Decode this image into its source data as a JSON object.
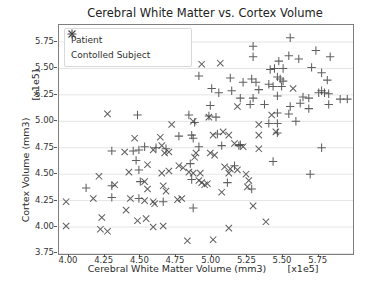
{
  "title": "Cerebral White Matter vs. Cortex Volume",
  "axes": {
    "xlabel": "Cerebral White Matter Volume (mm3)",
    "x_offset_label": "[x1e5]",
    "ylabel": "Cortex Volume (mm3)",
    "y_offset_label": "[x1e5]"
  },
  "legend": {
    "entries": [
      {
        "marker": "x",
        "label": "Patient"
      },
      {
        "marker": "+",
        "label": "Contolled Subject"
      }
    ]
  },
  "colors": {
    "marker": "#444444",
    "grid": "#e5e5e5",
    "frame": "#7f7f7f",
    "tick": "#555555"
  },
  "chart_data": {
    "type": "scatter",
    "title": "Cerebral White Matter vs. Cortex Volume",
    "xlabel": "Cerebral White Matter Volume (mm3)",
    "ylabel": "Cortex Volume (mm3)",
    "x_scale": "x1e5",
    "y_scale": "x1e5",
    "xlim": [
      3.93,
      5.99
    ],
    "ylim": [
      3.745,
      5.911
    ],
    "x_ticks": [
      "4.00",
      "4.25",
      "4.50",
      "4.75",
      "5.00",
      "5.25",
      "5.50",
      "5.75"
    ],
    "y_ticks": [
      "3.75",
      "4.00",
      "4.25",
      "4.50",
      "4.75",
      "5.00",
      "5.25",
      "5.50",
      "5.75"
    ],
    "grid": "horizontal",
    "legend_position": "upper left",
    "series": [
      {
        "name": "Patient",
        "marker": "x",
        "points": [
          [
            4.93,
            5.54
          ],
          [
            5.06,
            5.55
          ],
          [
            4.27,
            5.07
          ],
          [
            4.46,
            4.84
          ],
          [
            4.39,
            4.71
          ],
          [
            4.59,
            4.73
          ],
          [
            4.55,
            4.59
          ],
          [
            4.42,
            4.52
          ],
          [
            4.21,
            4.48
          ],
          [
            5.18,
            5.14
          ],
          [
            4.87,
            5.0
          ],
          [
            4.98,
            5.04
          ],
          [
            4.72,
            4.97
          ],
          [
            5.01,
            4.87
          ],
          [
            5.08,
            4.9
          ],
          [
            5.12,
            4.87
          ],
          [
            4.64,
            4.85
          ],
          [
            4.65,
            4.77
          ],
          [
            4.7,
            4.71
          ],
          [
            4.67,
            4.7
          ],
          [
            4.89,
            4.7
          ],
          [
            4.88,
            4.66
          ],
          [
            4.99,
            4.7
          ],
          [
            5.02,
            4.68
          ],
          [
            5.16,
            4.79
          ],
          [
            5.22,
            4.76
          ],
          [
            4.77,
            4.58
          ],
          [
            4.8,
            4.56
          ],
          [
            4.7,
            4.53
          ],
          [
            4.65,
            4.51
          ],
          [
            4.84,
            4.52
          ],
          [
            4.87,
            4.51
          ],
          [
            4.92,
            4.51
          ],
          [
            5.09,
            4.57
          ],
          [
            5.13,
            4.55
          ],
          [
            5.18,
            4.54
          ],
          [
            5.12,
            4.51
          ],
          [
            5.24,
            4.5
          ],
          [
            5.57,
            5.31
          ],
          [
            5.42,
            5.06
          ],
          [
            5.45,
            4.9
          ],
          [
            5.33,
            4.97
          ],
          [
            5.33,
            4.87
          ],
          [
            5.33,
            4.74
          ],
          [
            4.32,
            4.4
          ],
          [
            4.53,
            4.43
          ],
          [
            4.55,
            4.36
          ],
          [
            3.98,
            4.24
          ],
          [
            4.17,
            4.27
          ],
          [
            4.43,
            4.27
          ],
          [
            4.53,
            4.25
          ],
          [
            4.59,
            4.24
          ],
          [
            4.6,
            4.22
          ],
          [
            4.4,
            4.16
          ],
          [
            4.23,
            4.09
          ],
          [
            3.98,
            4.01
          ],
          [
            4.48,
            4.06
          ],
          [
            4.54,
            4.08
          ],
          [
            4.22,
            3.98
          ],
          [
            4.27,
            3.96
          ],
          [
            4.59,
            4.0
          ],
          [
            4.91,
            4.44
          ],
          [
            4.93,
            4.42
          ],
          [
            4.95,
            4.4
          ],
          [
            4.97,
            4.41
          ],
          [
            4.66,
            4.39
          ],
          [
            4.68,
            4.34
          ],
          [
            5.07,
            4.33
          ],
          [
            5.25,
            4.38
          ],
          [
            5.26,
            4.44
          ],
          [
            4.76,
            4.26
          ],
          [
            4.79,
            4.27
          ],
          [
            5.29,
            4.2
          ],
          [
            4.66,
            4.01
          ],
          [
            5.12,
            3.99
          ],
          [
            4.83,
            3.87
          ],
          [
            5.01,
            3.88
          ],
          [
            5.38,
            4.05
          ]
        ]
      },
      {
        "name": "Contolled Subject",
        "marker": "+",
        "points": [
          [
            5.29,
            5.71
          ],
          [
            5.29,
            5.61
          ],
          [
            4.91,
            5.43
          ],
          [
            5.13,
            5.41
          ],
          [
            5.22,
            5.37
          ],
          [
            5.28,
            5.4
          ],
          [
            5.31,
            5.37
          ],
          [
            5.0,
            5.31
          ],
          [
            5.05,
            5.27
          ],
          [
            5.14,
            5.29
          ],
          [
            5.2,
            5.22
          ],
          [
            5.29,
            5.22
          ],
          [
            5.55,
            5.79
          ],
          [
            5.54,
            5.62
          ],
          [
            5.61,
            5.59
          ],
          [
            5.73,
            5.67
          ],
          [
            5.83,
            5.61
          ],
          [
            5.47,
            5.57
          ],
          [
            5.7,
            5.51
          ],
          [
            5.41,
            5.49
          ],
          [
            5.44,
            5.5
          ],
          [
            5.5,
            5.5
          ],
          [
            5.77,
            5.46
          ],
          [
            5.81,
            5.39
          ],
          [
            5.46,
            5.42
          ],
          [
            5.48,
            5.4
          ],
          [
            5.5,
            5.38
          ],
          [
            5.4,
            5.35
          ],
          [
            5.43,
            5.33
          ],
          [
            5.49,
            5.33
          ],
          [
            5.77,
            5.29
          ],
          [
            5.79,
            5.27
          ],
          [
            5.82,
            5.26
          ],
          [
            5.75,
            5.27
          ],
          [
            5.33,
            5.3
          ],
          [
            5.46,
            5.24
          ],
          [
            5.64,
            5.23
          ],
          [
            5.68,
            5.22
          ],
          [
            5.9,
            5.21
          ],
          [
            5.95,
            5.21
          ],
          [
            4.48,
            5.06
          ],
          [
            4.3,
            4.72
          ],
          [
            4.45,
            4.72
          ],
          [
            4.49,
            4.73
          ],
          [
            4.53,
            4.76
          ],
          [
            4.61,
            4.75
          ],
          [
            4.47,
            4.63
          ],
          [
            4.49,
            4.54
          ],
          [
            4.99,
            5.15
          ],
          [
            5.27,
            5.16
          ],
          [
            4.84,
            5.06
          ],
          [
            4.88,
            4.99
          ],
          [
            4.98,
            5.05
          ],
          [
            5.03,
            5.04
          ],
          [
            4.86,
            4.87
          ],
          [
            4.87,
            4.84
          ],
          [
            5.04,
            4.88
          ],
          [
            4.77,
            4.86
          ],
          [
            4.68,
            4.74
          ],
          [
            4.91,
            4.76
          ],
          [
            5.07,
            4.77
          ],
          [
            5.19,
            4.77
          ],
          [
            5.2,
            4.78
          ],
          [
            4.85,
            4.6
          ],
          [
            5.16,
            4.58
          ],
          [
            5.37,
            5.16
          ],
          [
            5.55,
            5.14
          ],
          [
            5.62,
            5.17
          ],
          [
            5.68,
            5.12
          ],
          [
            5.82,
            5.16
          ],
          [
            5.46,
            5.08
          ],
          [
            5.54,
            5.07
          ],
          [
            5.59,
            5.0
          ],
          [
            5.4,
            4.98
          ],
          [
            5.46,
            4.98
          ],
          [
            5.46,
            4.89
          ],
          [
            5.77,
            4.75
          ],
          [
            5.43,
            4.62
          ],
          [
            5.69,
            4.5
          ],
          [
            4.12,
            4.37
          ],
          [
            4.3,
            4.39
          ],
          [
            4.5,
            4.43
          ],
          [
            4.3,
            4.28
          ],
          [
            4.49,
            4.27
          ],
          [
            5.11,
            4.42
          ],
          [
            5.28,
            4.36
          ],
          [
            4.66,
            4.24
          ],
          [
            4.87,
            4.18
          ],
          [
            4.86,
            4.45
          ]
        ]
      }
    ]
  }
}
